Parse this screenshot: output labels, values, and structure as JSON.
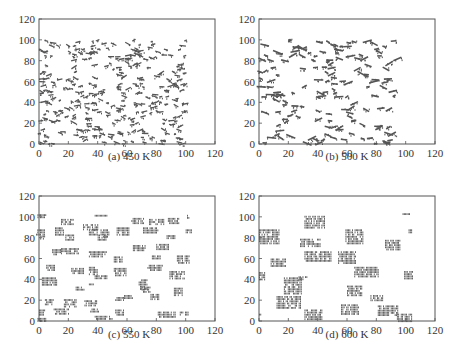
{
  "chart_data": [
    {
      "type": "scatter",
      "caption": "(a) 450 K",
      "title": "",
      "xlabel": "",
      "ylabel": "",
      "xlim": [
        0,
        120
      ],
      "ylim": [
        0,
        120
      ],
      "xticks": [
        0,
        20,
        40,
        60,
        80,
        100,
        120
      ],
      "yticks": [
        0,
        20,
        40,
        60,
        80,
        100,
        120
      ],
      "description": "Dense, fine-grained distribution of small atom clusters filling domain 0-100 x 0-100",
      "cluster_size": "small",
      "cluster_count_estimate": 320,
      "seed": 11,
      "clusters": []
    },
    {
      "type": "scatter",
      "caption": "(b) 500 K",
      "title": "",
      "xlabel": "",
      "ylabel": "",
      "xlim": [
        0,
        120
      ],
      "ylim": [
        0,
        120
      ],
      "xticks": [
        0,
        20,
        40,
        60,
        80,
        100,
        120
      ],
      "yticks": [
        0,
        20,
        40,
        60,
        80,
        100,
        120
      ],
      "description": "Fewer, slightly larger elongated clusters over 0-100 x 0-100",
      "cluster_size": "medium",
      "cluster_count_estimate": 160,
      "seed": 23,
      "clusters": []
    },
    {
      "type": "scatter",
      "caption": "(c) 550 K",
      "title": "",
      "xlabel": "",
      "ylabel": "",
      "xlim": [
        0,
        120
      ],
      "ylim": [
        0,
        120
      ],
      "xticks": [
        0,
        20,
        40,
        60,
        80,
        100,
        120
      ],
      "yticks": [
        0,
        20,
        40,
        60,
        80,
        100,
        120
      ],
      "description": "Coarsened islands of hatched atoms",
      "cluster_size": "large",
      "clusters": [
        [
          2,
          101,
          3,
          1.5
        ],
        [
          1,
          85,
          3,
          3
        ],
        [
          2,
          80,
          2,
          2
        ],
        [
          19,
          95,
          4,
          3
        ],
        [
          14,
          86,
          3,
          4
        ],
        [
          21,
          80,
          3,
          3
        ],
        [
          42,
          101,
          4,
          1
        ],
        [
          35,
          90,
          5,
          3
        ],
        [
          37,
          85,
          3,
          3
        ],
        [
          45,
          84,
          3,
          4
        ],
        [
          43,
          80,
          3,
          3
        ],
        [
          57,
          86,
          4,
          4
        ],
        [
          67,
          96,
          4,
          3
        ],
        [
          80,
          95,
          5,
          3
        ],
        [
          91,
          96,
          4,
          3
        ],
        [
          76,
          87,
          5,
          3
        ],
        [
          90,
          81,
          3,
          1.5
        ],
        [
          102,
          86,
          2,
          2
        ],
        [
          102,
          100,
          1,
          2
        ],
        [
          21,
          67,
          6,
          3
        ],
        [
          12,
          66,
          3,
          3
        ],
        [
          40,
          64,
          6,
          3
        ],
        [
          54,
          59,
          3,
          3
        ],
        [
          68,
          70,
          4,
          3
        ],
        [
          84,
          71,
          4,
          3
        ],
        [
          80,
          61,
          3,
          2
        ],
        [
          98,
          59,
          4,
          4
        ],
        [
          8,
          51,
          3,
          3
        ],
        [
          26,
          48,
          4,
          3
        ],
        [
          37,
          48,
          3,
          4
        ],
        [
          42,
          42,
          4,
          2
        ],
        [
          55,
          47,
          4,
          4
        ],
        [
          79,
          51,
          5,
          3
        ],
        [
          94,
          44,
          5,
          4
        ],
        [
          7,
          38,
          5,
          4
        ],
        [
          36,
          35,
          2,
          1
        ],
        [
          28,
          31,
          3,
          2
        ],
        [
          71,
          35,
          3,
          5
        ],
        [
          73,
          30,
          3,
          3
        ],
        [
          79,
          23,
          3,
          3
        ],
        [
          95,
          28,
          3,
          4
        ],
        [
          7,
          18,
          3,
          3
        ],
        [
          21,
          17,
          4,
          4
        ],
        [
          35,
          17,
          4,
          3
        ],
        [
          38,
          10,
          3,
          2
        ],
        [
          55,
          21,
          3,
          2
        ],
        [
          61,
          23,
          3,
          2
        ],
        [
          15,
          9,
          5,
          3
        ],
        [
          2,
          8,
          2,
          3
        ],
        [
          2,
          1,
          3,
          2
        ],
        [
          44,
          3,
          6,
          2
        ],
        [
          55,
          8,
          3,
          3
        ],
        [
          87,
          6,
          6,
          3
        ],
        [
          99,
          7,
          3,
          2
        ]
      ]
    },
    {
      "type": "scatter",
      "caption": "(d) 600 K",
      "title": "",
      "xlabel": "",
      "ylabel": "",
      "xlim": [
        0,
        120
      ],
      "ylim": [
        0,
        120
      ],
      "xticks": [
        0,
        20,
        40,
        60,
        80,
        100,
        120
      ],
      "yticks": [
        0,
        20,
        40,
        60,
        80,
        100,
        120
      ],
      "description": "Strongly coarsened large islands of hatched atoms",
      "cluster_size": "very large",
      "clusters": [
        [
          38,
          95,
          7,
          6
        ],
        [
          7,
          81,
          7,
          7
        ],
        [
          65,
          81,
          6,
          7
        ],
        [
          35,
          75,
          7,
          4
        ],
        [
          91,
          73,
          5,
          5
        ],
        [
          13,
          56,
          5,
          4
        ],
        [
          40,
          62,
          9,
          5
        ],
        [
          60,
          61,
          6,
          6
        ],
        [
          2,
          43,
          2,
          4
        ],
        [
          73,
          47,
          8,
          5
        ],
        [
          102,
          44,
          3,
          4
        ],
        [
          30,
          41,
          3,
          2
        ],
        [
          23,
          34,
          6,
          8
        ],
        [
          65,
          29,
          5,
          5
        ],
        [
          80,
          22,
          4,
          3
        ],
        [
          20,
          18,
          8,
          6
        ],
        [
          37,
          6,
          6,
          5
        ],
        [
          62,
          11,
          6,
          5
        ],
        [
          88,
          10,
          7,
          5
        ],
        [
          99,
          3,
          5,
          4
        ],
        [
          1,
          6,
          1,
          1
        ],
        [
          100,
          103,
          3,
          0.5
        ],
        [
          103,
          86,
          1,
          2
        ]
      ]
    }
  ],
  "panels": [
    {
      "caption": "(a) 450 K"
    },
    {
      "caption": "(b) 500 K"
    },
    {
      "caption": "(c) 550 K"
    },
    {
      "caption": "(d) 600 K"
    }
  ],
  "colors": {
    "points": "#555555",
    "axis": "#555555",
    "text": "#333333",
    "background": "#ffffff"
  }
}
